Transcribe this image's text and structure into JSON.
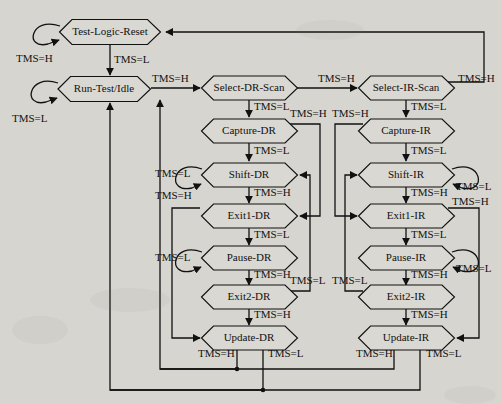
{
  "diagram": {
    "background_color": "#d7d5cf",
    "line_color": "#111111",
    "node_fill": "#dad8d2",
    "signal_high": "TMS=H",
    "signal_low": "TMS=L",
    "nodes": [
      {
        "id": "test-logic-reset",
        "label": "Test-Logic-Reset",
        "cx": 110,
        "cy": 32,
        "w": 101,
        "h": 25
      },
      {
        "id": "run-test-idle",
        "label": "Run-Test/Idle",
        "cx": 104,
        "cy": 89,
        "w": 92,
        "h": 25
      },
      {
        "id": "select-dr-scan",
        "label": "Select-DR-Scan",
        "cx": 249,
        "cy": 88,
        "w": 95,
        "h": 24
      },
      {
        "id": "capture-dr",
        "label": "Capture-DR",
        "cx": 249,
        "cy": 131,
        "w": 95,
        "h": 24
      },
      {
        "id": "shift-dr",
        "label": "Shift-DR",
        "cx": 249,
        "cy": 175,
        "w": 95,
        "h": 24
      },
      {
        "id": "exit1-dr",
        "label": "Exit1-DR",
        "cx": 249,
        "cy": 216,
        "w": 95,
        "h": 24
      },
      {
        "id": "pause-dr",
        "label": "Pause-DR",
        "cx": 249,
        "cy": 258,
        "w": 95,
        "h": 24
      },
      {
        "id": "exit2-dr",
        "label": "Exit2-DR",
        "cx": 249,
        "cy": 297,
        "w": 95,
        "h": 24
      },
      {
        "id": "update-dr",
        "label": "Update-DR",
        "cx": 249,
        "cy": 338,
        "w": 95,
        "h": 24
      },
      {
        "id": "select-ir-scan",
        "label": "Select-IR-Scan",
        "cx": 406,
        "cy": 88,
        "w": 95,
        "h": 24
      },
      {
        "id": "capture-ir",
        "label": "Capture-IR",
        "cx": 406,
        "cy": 131,
        "w": 95,
        "h": 24
      },
      {
        "id": "shift-ir",
        "label": "Shift-IR",
        "cx": 406,
        "cy": 175,
        "w": 95,
        "h": 24
      },
      {
        "id": "exit1-ir",
        "label": "Exit1-IR",
        "cx": 406,
        "cy": 216,
        "w": 95,
        "h": 24
      },
      {
        "id": "pause-ir",
        "label": "Pause-IR",
        "cx": 406,
        "cy": 258,
        "w": 95,
        "h": 24
      },
      {
        "id": "exit2-ir",
        "label": "Exit2-IR",
        "cx": 406,
        "cy": 297,
        "w": 95,
        "h": 24
      },
      {
        "id": "update-ir",
        "label": "Update-IR",
        "cx": 406,
        "cy": 338,
        "w": 95,
        "h": 24
      }
    ],
    "edge_labels": [
      {
        "id": "lbl-tlr-self",
        "text": "TMS=H",
        "x": 16,
        "y": 62
      },
      {
        "id": "lbl-tlr-to-rti",
        "text": "TMS=L",
        "x": 114,
        "y": 63
      },
      {
        "id": "lbl-rti-self",
        "text": "TMS=L",
        "x": 12,
        "y": 122
      },
      {
        "id": "lbl-rti-to-seldr",
        "text": "TMS=H",
        "x": 152,
        "y": 82
      },
      {
        "id": "lbl-seldr-to-capdr",
        "text": "TMS=L",
        "x": 254,
        "y": 110
      },
      {
        "id": "lbl-seldr-to-selir",
        "text": "TMS=H",
        "x": 318,
        "y": 82
      },
      {
        "id": "lbl-capdr-to-shiftdr",
        "text": "TMS=L",
        "x": 254,
        "y": 154
      },
      {
        "id": "lbl-capdr-to-ex1dr",
        "text": "TMS=H",
        "x": 290,
        "y": 117
      },
      {
        "id": "lbl-shiftdr-self",
        "text": "TMS=L",
        "x": 155,
        "y": 177
      },
      {
        "id": "lbl-shiftdr-to-ex1dr",
        "text": "TMS=H",
        "x": 254,
        "y": 196
      },
      {
        "id": "lbl-ex1dr-to-update",
        "text": "TMS=H",
        "x": 155,
        "y": 199
      },
      {
        "id": "lbl-ex1dr-to-pausedr",
        "text": "TMS=L",
        "x": 254,
        "y": 238
      },
      {
        "id": "lbl-pausedr-self",
        "text": "TMS=L",
        "x": 155,
        "y": 261
      },
      {
        "id": "lbl-pausedr-to-ex2dr",
        "text": "TMS=H",
        "x": 254,
        "y": 278
      },
      {
        "id": "lbl-ex2dr-to-shiftdr",
        "text": "TMS=L",
        "x": 290,
        "y": 284
      },
      {
        "id": "lbl-ex2dr-to-update",
        "text": "TMS=H",
        "x": 254,
        "y": 318
      },
      {
        "id": "lbl-updatedr-h",
        "text": "TMS=H",
        "x": 198,
        "y": 357
      },
      {
        "id": "lbl-updatedr-l",
        "text": "TMS=L",
        "x": 268,
        "y": 357
      },
      {
        "id": "lbl-selir-to-tlr",
        "text": "TMS=H",
        "x": 458,
        "y": 82
      },
      {
        "id": "lbl-selir-to-capir",
        "text": "TMS=L",
        "x": 411,
        "y": 110
      },
      {
        "id": "lbl-capir-to-ex1ir",
        "text": "TMS=H",
        "x": 332,
        "y": 117
      },
      {
        "id": "lbl-capir-to-shiftir",
        "text": "TMS=L",
        "x": 411,
        "y": 154
      },
      {
        "id": "lbl-shiftir-self",
        "text": "TMS=L",
        "x": 456,
        "y": 190
      },
      {
        "id": "lbl-shiftir-to-ex1ir",
        "text": "TMS=H",
        "x": 411,
        "y": 196
      },
      {
        "id": "lbl-ex1ir-to-update",
        "text": "TMS=H",
        "x": 452,
        "y": 205
      },
      {
        "id": "lbl-ex1ir-to-pauseir",
        "text": "TMS=L",
        "x": 411,
        "y": 238
      },
      {
        "id": "lbl-pauseir-self",
        "text": "TMS=L",
        "x": 456,
        "y": 272
      },
      {
        "id": "lbl-pauseir-to-ex2ir",
        "text": "TMS=H",
        "x": 411,
        "y": 278
      },
      {
        "id": "lbl-ex2ir-to-shiftir",
        "text": "TMS=L",
        "x": 332,
        "y": 284
      },
      {
        "id": "lbl-ex2ir-to-update",
        "text": "TMS=H",
        "x": 411,
        "y": 318
      },
      {
        "id": "lbl-updateir-h",
        "text": "TMS=H",
        "x": 356,
        "y": 357
      },
      {
        "id": "lbl-updateir-l",
        "text": "TMS=L",
        "x": 426,
        "y": 357
      }
    ]
  }
}
